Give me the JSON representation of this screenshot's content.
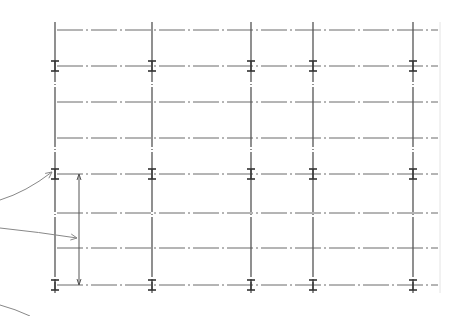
{
  "diagram": {
    "type": "structural-grid-plan",
    "colors": {
      "background": "#ffffff",
      "line": "#6a6a6a",
      "column_line": "#555555",
      "leader": "#888888",
      "border_faint": "#e4e4e4"
    },
    "grid": {
      "columns_x": [
        55,
        152,
        251,
        313,
        413
      ],
      "column_top": 22,
      "column_bottom": 293,
      "rows_y": [
        30,
        66,
        102,
        138,
        174,
        213,
        248,
        285
      ],
      "row_left": 57,
      "row_right": 438,
      "beam_rows_with_column_markers": [
        66,
        174,
        285
      ],
      "right_edge_x": 440
    },
    "dimension_line": {
      "x": 79,
      "y_top": 174,
      "y_bottom": 285
    },
    "leaders": [
      {
        "name": "leader-to-column-marker",
        "from": [
          0,
          200
        ],
        "to": [
          52,
          172
        ]
      },
      {
        "name": "leader-to-dimension",
        "from": [
          0,
          228
        ],
        "to": [
          77,
          238
        ]
      },
      {
        "name": "leader-bottom-left",
        "from": [
          0,
          305
        ],
        "to": [
          30,
          316
        ]
      }
    ]
  }
}
